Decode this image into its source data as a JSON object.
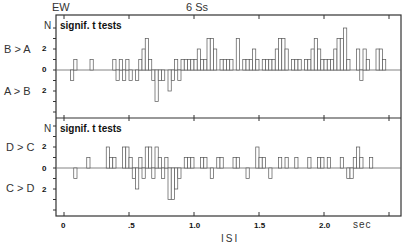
{
  "header": {
    "left": "EW",
    "center": "6 Ss"
  },
  "chart_data": [
    {
      "type": "bar",
      "title": "signif. t tests",
      "ylabel": "N",
      "upper_label": "B > A",
      "lower_label": "A > B",
      "yticks": [
        "2",
        "0",
        "2"
      ],
      "xlabel": "ISI",
      "x_unit": "sec",
      "xlim": [
        0,
        2.6
      ],
      "ylim": [
        -4,
        4
      ],
      "bin_width": 0.025,
      "bars": [
        [
          0.05,
          -1
        ],
        [
          0.075,
          1
        ],
        [
          0.2,
          1
        ],
        [
          0.375,
          1
        ],
        [
          0.4,
          -1
        ],
        [
          0.425,
          1
        ],
        [
          0.45,
          -1
        ],
        [
          0.475,
          1
        ],
        [
          0.5,
          -1
        ],
        [
          0.55,
          -1
        ],
        [
          0.575,
          1
        ],
        [
          0.6,
          2
        ],
        [
          0.625,
          3
        ],
        [
          0.65,
          1
        ],
        [
          0.675,
          -1
        ],
        [
          0.7,
          -3
        ],
        [
          0.725,
          -1
        ],
        [
          0.75,
          -1
        ],
        [
          0.8,
          -2
        ],
        [
          0.825,
          -1
        ],
        [
          0.85,
          1
        ],
        [
          0.875,
          -1
        ],
        [
          0.9,
          1
        ],
        [
          0.925,
          1
        ],
        [
          0.95,
          1
        ],
        [
          0.975,
          1
        ],
        [
          1.0,
          1
        ],
        [
          1.025,
          2
        ],
        [
          1.05,
          1
        ],
        [
          1.075,
          1
        ],
        [
          1.1,
          3
        ],
        [
          1.125,
          3
        ],
        [
          1.15,
          2
        ],
        [
          1.2,
          1
        ],
        [
          1.225,
          1
        ],
        [
          1.25,
          1
        ],
        [
          1.275,
          1
        ],
        [
          1.325,
          3
        ],
        [
          1.375,
          1
        ],
        [
          1.4,
          1
        ],
        [
          1.425,
          1
        ],
        [
          1.45,
          2
        ],
        [
          1.475,
          1
        ],
        [
          1.525,
          1
        ],
        [
          1.55,
          1
        ],
        [
          1.575,
          1
        ],
        [
          1.6,
          1
        ],
        [
          1.625,
          2
        ],
        [
          1.65,
          3
        ],
        [
          1.675,
          3
        ],
        [
          1.7,
          2
        ],
        [
          1.75,
          1
        ],
        [
          1.775,
          1
        ],
        [
          1.8,
          1
        ],
        [
          1.85,
          1
        ],
        [
          1.875,
          1
        ],
        [
          1.9,
          2
        ],
        [
          1.925,
          3
        ],
        [
          1.95,
          2
        ],
        [
          1.975,
          1
        ],
        [
          2.0,
          1
        ],
        [
          2.025,
          1
        ],
        [
          2.05,
          1
        ],
        [
          2.075,
          2
        ],
        [
          2.1,
          3
        ],
        [
          2.125,
          3
        ],
        [
          2.15,
          4
        ],
        [
          2.175,
          1
        ],
        [
          2.25,
          2
        ],
        [
          2.275,
          -1
        ],
        [
          2.3,
          2
        ],
        [
          2.325,
          1
        ],
        [
          2.4,
          2
        ],
        [
          2.425,
          2
        ],
        [
          2.45,
          1
        ]
      ]
    },
    {
      "type": "bar",
      "title": "signif. t tests",
      "ylabel": "N",
      "upper_label": "D > C",
      "lower_label": "C > D",
      "yticks": [
        "2",
        "0",
        "2"
      ],
      "xlabel": "ISI",
      "x_unit": "sec",
      "xticks": [
        "0",
        ".5",
        "1.0",
        "1.5",
        "2.0"
      ],
      "xlim": [
        0,
        2.6
      ],
      "ylim": [
        -4,
        4
      ],
      "bin_width": 0.025,
      "bars": [
        [
          0.075,
          -1
        ],
        [
          0.175,
          1
        ],
        [
          0.325,
          2
        ],
        [
          0.35,
          1
        ],
        [
          0.375,
          1
        ],
        [
          0.45,
          2
        ],
        [
          0.475,
          2
        ],
        [
          0.5,
          1
        ],
        [
          0.525,
          -1
        ],
        [
          0.55,
          -2
        ],
        [
          0.575,
          1
        ],
        [
          0.6,
          -1
        ],
        [
          0.625,
          2
        ],
        [
          0.65,
          2
        ],
        [
          0.675,
          -1
        ],
        [
          0.7,
          2
        ],
        [
          0.725,
          1
        ],
        [
          0.75,
          -1
        ],
        [
          0.775,
          1
        ],
        [
          0.8,
          -3
        ],
        [
          0.825,
          -3
        ],
        [
          0.85,
          -2
        ],
        [
          0.875,
          -1
        ],
        [
          0.925,
          1
        ],
        [
          0.95,
          1
        ],
        [
          0.975,
          1
        ],
        [
          1.05,
          1
        ],
        [
          1.075,
          1
        ],
        [
          1.125,
          -1
        ],
        [
          1.175,
          1
        ],
        [
          1.2,
          1
        ],
        [
          1.3,
          1
        ],
        [
          1.325,
          1
        ],
        [
          1.4,
          -1
        ],
        [
          1.475,
          2
        ],
        [
          1.5,
          1
        ],
        [
          1.525,
          1
        ],
        [
          1.575,
          -1
        ],
        [
          1.65,
          1
        ],
        [
          1.7,
          1
        ],
        [
          1.775,
          1
        ],
        [
          1.875,
          1
        ],
        [
          1.95,
          1
        ],
        [
          1.975,
          1
        ],
        [
          2.025,
          1
        ],
        [
          2.125,
          1
        ],
        [
          2.175,
          -1
        ],
        [
          2.2,
          -1
        ],
        [
          2.225,
          1
        ],
        [
          2.25,
          2
        ],
        [
          2.275,
          1
        ],
        [
          2.35,
          1
        ]
      ]
    }
  ],
  "axis": {
    "xlabel": "ISI",
    "unit": "sec",
    "xticks": [
      {
        "v": 0,
        "label": "0"
      },
      {
        "v": 0.5,
        "label": ".5"
      },
      {
        "v": 1.0,
        "label": "1.0"
      },
      {
        "v": 1.5,
        "label": "1.5"
      },
      {
        "v": 2.0,
        "label": "2.0"
      }
    ]
  }
}
